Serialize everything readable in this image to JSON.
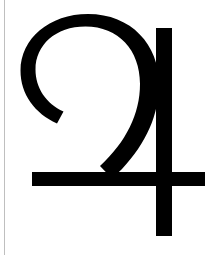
{
  "image": {
    "kind": "astronomical-symbol-glyph",
    "symbol_name": "Jupiter",
    "symbol_character": "♃",
    "caption": "",
    "width_px": 216,
    "height_px": 255
  },
  "colors": {
    "background": "#ffffff",
    "glyph": "#000000",
    "left_rule": "#bfbfbf"
  },
  "glyph": {
    "label": "Jupiter planetary symbol",
    "parts": [
      {
        "name": "crescent-hook-stroke",
        "label": "Crescent hook (upper-left curl)"
      },
      {
        "name": "descending-diagonal-stroke",
        "label": "Descending diagonal sweep"
      },
      {
        "name": "horizontal-crossbar-stroke",
        "label": "Horizontal crossbar"
      },
      {
        "name": "vertical-stem-stroke",
        "label": "Vertical stem"
      }
    ],
    "geometry": {
      "crossbar": {
        "x1": 32,
        "x2": 205,
        "y_top": 172,
        "y_bottom": 186,
        "thickness": 14
      },
      "stem": {
        "x_left": 156,
        "x_right": 172,
        "y_top": 28,
        "y_bottom": 236,
        "thickness": 16
      },
      "hook": {
        "arc_top_y": 27,
        "tail_x": 60,
        "tail_y": 110
      }
    }
  },
  "rule": {
    "name": "left-margin-rule",
    "x_px": 4,
    "width_px": 1
  }
}
